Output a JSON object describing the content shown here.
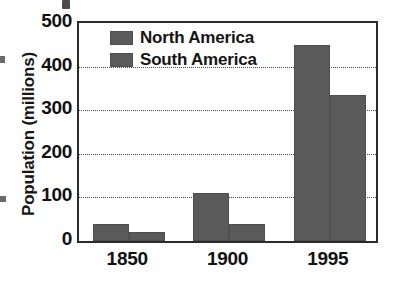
{
  "chart_data": {
    "type": "bar",
    "title": "",
    "xlabel": "",
    "ylabel": "Population (millions)",
    "categories": [
      "1850",
      "1900",
      "1995"
    ],
    "series": [
      {
        "name": "North America",
        "values": [
          40,
          110,
          450
        ],
        "color": "#5a5a5a"
      },
      {
        "name": "South America",
        "values": [
          20,
          40,
          335
        ],
        "color": "#5a5a5a"
      }
    ],
    "ylim": [
      0,
      500
    ],
    "yticks": [
      0,
      100,
      200,
      300,
      400,
      500
    ],
    "ytick_labels": [
      "0",
      "100",
      "200",
      "300",
      "400",
      "500"
    ],
    "gridlines": [
      100,
      200,
      300,
      400
    ],
    "grid": true,
    "legend_position": "top-left-inside",
    "frame": true
  },
  "legend": {
    "items": [
      {
        "label": "North America"
      },
      {
        "label": "South America"
      }
    ]
  },
  "axes": {
    "y_title": "Population (millions)",
    "y_labels": [
      "500",
      "400",
      "300",
      "200",
      "100",
      "0"
    ],
    "x_labels": [
      "1850",
      "1900",
      "1995"
    ]
  },
  "colors": {
    "bar_fill": "#5a5a5a",
    "bar_edge": "#4f4f4f",
    "frame": "#2b2b2b",
    "grid": "#4b4b4b",
    "text": "#111111",
    "background": "#ffffff"
  }
}
